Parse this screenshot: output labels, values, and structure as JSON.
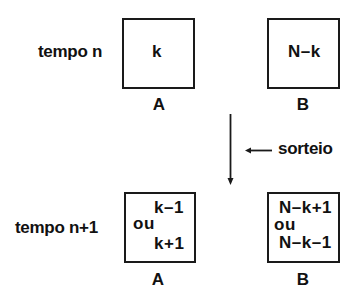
{
  "rows": {
    "time_n": {
      "label": "tempo n",
      "box_a": {
        "content": "k",
        "caption": "A"
      },
      "box_b": {
        "content": "N–k",
        "caption": "B"
      }
    },
    "time_n1": {
      "label": "tempo n+1",
      "box_a": {
        "line1": "k–1",
        "middle": "ou",
        "line2": "k+1",
        "caption": "A"
      },
      "box_b": {
        "line1": "N–k+1",
        "middle": "ou",
        "line2": "N–k–1",
        "caption": "B"
      }
    }
  },
  "transition": {
    "label": "sorteio",
    "arrow_icon": "arrow-down-icon",
    "pointer_icon": "arrow-left-icon"
  },
  "colors": {
    "line": "#1a1a1a",
    "background": "#ffffff"
  }
}
